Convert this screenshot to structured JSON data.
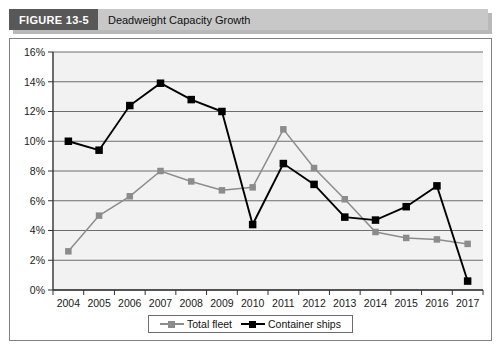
{
  "figure": {
    "tag": "FIGURE 13-5",
    "title": "Deadweight Capacity Growth"
  },
  "colors": {
    "total_fleet": "#8c8c8c",
    "container_ships": "#000000",
    "tag_background": "#585858",
    "title_background": "#c8c8c8",
    "plot_background": "#f2f2f2",
    "gridline": "#6e6e6e",
    "frame_border": "#808080"
  },
  "legend": {
    "position": "bottom-center",
    "entries": [
      {
        "label": "Total fleet",
        "color": "#8c8c8c"
      },
      {
        "label": "Container ships",
        "color": "#000000"
      }
    ]
  },
  "axis": {
    "y_ticks": [
      "0%",
      "2%",
      "4%",
      "6%",
      "8%",
      "10%",
      "12%",
      "14%",
      "16%"
    ],
    "x_ticks": [
      "2004",
      "2005",
      "2006",
      "2007",
      "2008",
      "2009",
      "2010",
      "2011",
      "2012",
      "2013",
      "2014",
      "2015",
      "2016",
      "2017"
    ]
  },
  "chart_data": {
    "type": "line",
    "title": "Deadweight Capacity Growth",
    "xlabel": "",
    "ylabel": "",
    "ylim": [
      0,
      16
    ],
    "ytick_step": 2,
    "ytick_format": "percent",
    "grid": true,
    "legend_position": "bottom-center",
    "categories": [
      "2004",
      "2005",
      "2006",
      "2007",
      "2008",
      "2009",
      "2010",
      "2011",
      "2012",
      "2013",
      "2014",
      "2015",
      "2016",
      "2017"
    ],
    "series": [
      {
        "name": "Total fleet",
        "color": "#8c8c8c",
        "marker": "square",
        "values": [
          2.6,
          5.0,
          6.3,
          8.0,
          7.3,
          6.7,
          6.9,
          10.8,
          8.2,
          6.1,
          3.9,
          3.5,
          3.4,
          3.1
        ]
      },
      {
        "name": "Container ships",
        "color": "#000000",
        "marker": "square",
        "values": [
          10.0,
          9.4,
          12.4,
          13.9,
          12.8,
          12.0,
          4.4,
          8.5,
          7.1,
          4.9,
          4.7,
          5.6,
          7.0,
          0.6
        ]
      }
    ]
  }
}
